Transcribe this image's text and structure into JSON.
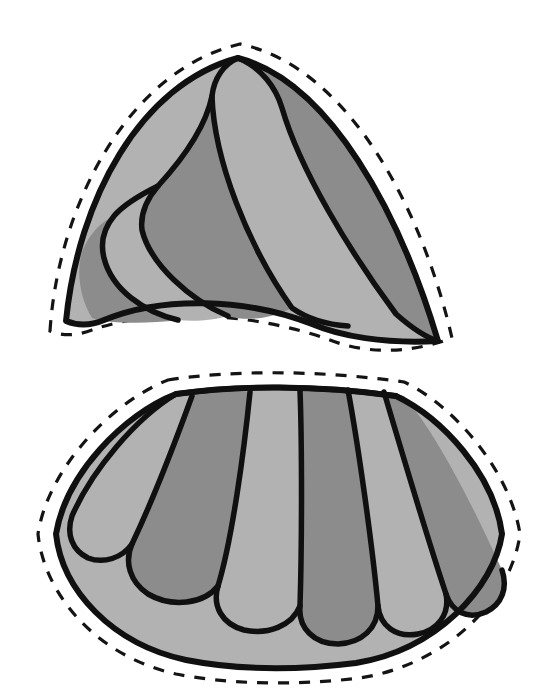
{
  "document": {
    "kind": "line-art-pattern-template",
    "title": "Two-piece fan pattern template",
    "background_color": "#ffffff",
    "ink_color": "#101010",
    "canvas": {
      "width": 560,
      "height": 691
    }
  },
  "palette": {
    "light_gray": "#b2b2b2",
    "dark_gray": "#8c8c8c",
    "outline_black": "#101010",
    "paper_white": "#ffffff"
  },
  "legend": {
    "solid_line_meaning": "sewn seam / stitching line",
    "dashed_line_meaning": "cutting line with seam allowance"
  },
  "pieces": [
    {
      "id": "upper-piece",
      "name": "Upper dome piece",
      "silhouette": "dome / pointed arch with curved base",
      "has_dashed_cut_line": true,
      "seam_allowance_px": 14,
      "segment_count": 5,
      "segments": [
        {
          "index": 1,
          "name": "outer-left-band",
          "tone": "light"
        },
        {
          "index": 2,
          "name": "inner-left-lobe",
          "tone": "light"
        },
        {
          "index": 3,
          "name": "mid-left-lobe",
          "tone": "dark"
        },
        {
          "index": 4,
          "name": "center-lobe",
          "tone": "light"
        },
        {
          "index": 5,
          "name": "right-lobe",
          "tone": "dark"
        }
      ],
      "bounds": {
        "x": 52,
        "y": 36,
        "width": 400,
        "height": 320
      }
    },
    {
      "id": "lower-piece",
      "name": "Lower fan / skirt piece",
      "silhouette": "fan — narrow curved top edge flaring to wide rounded bottom",
      "has_dashed_cut_line": true,
      "seam_allowance_px": 14,
      "segment_count": 8,
      "segments": [
        {
          "index": 1,
          "name": "petal-1",
          "tone": "light"
        },
        {
          "index": 2,
          "name": "petal-2",
          "tone": "dark"
        },
        {
          "index": 3,
          "name": "petal-3",
          "tone": "light"
        },
        {
          "index": 4,
          "name": "petal-4",
          "tone": "dark"
        },
        {
          "index": 5,
          "name": "petal-5",
          "tone": "light"
        },
        {
          "index": 6,
          "name": "petal-6",
          "tone": "dark"
        },
        {
          "index": 7,
          "name": "petal-7",
          "tone": "light"
        },
        {
          "index": 8,
          "name": "petal-8",
          "tone": "dark"
        }
      ],
      "base_band": {
        "name": "lower-ground-band",
        "tone": "light"
      },
      "bounds": {
        "x": 40,
        "y": 378,
        "width": 480,
        "height": 300
      }
    }
  ],
  "geometry": {
    "upper": {
      "cut_path": "M 50 331 C 58 206 128 70 240 44 C 352 68 424 216 452 338 C 404 356 360 352 330 340 C 258 314 160 306 92 330 C 76 336 62 336 50 331 Z",
      "seam_path": "M 66 321 C 78 200 140 84 238 58 C 330 82 400 214 438 341 C 384 344 340 336 312 324 C 246 298 162 296 104 320 C 90 326 78 326 66 321 Z",
      "fill_base_tone": "light",
      "seg_paths": [
        {
          "tone": "dark",
          "d": "M 438 341 C 400 214 330 82 238 58 C 262 68 276 88 282 108 C 300 170 350 252 396 314 C 414 330 428 338 438 341 Z"
        },
        {
          "tone": "light",
          "d": "M 396 318 C 352 252 300 170 282 108 C 276 86 260 66 238 58 C 224 64 214 78 212 96 C 214 160 248 246 292 308 C 310 322 328 324 344 326 C 364 328 382 322 396 318 Z"
        },
        {
          "tone": "dark",
          "d": "M 292 308 C 248 246 214 160 212 96 C 205 130 180 162 158 186 C 146 200 140 214 142 230 C 150 264 190 300 228 316 C 248 322 272 318 292 308 Z"
        },
        {
          "tone": "light",
          "d": "M 228 316 C 190 300 150 264 142 230 C 140 214 146 200 158 186 C 142 194 124 204 114 216 C 104 228 100 242 104 258 C 112 290 144 312 178 320 C 196 322 214 320 228 316 Z"
        },
        {
          "tone": "dark",
          "d": "M 178 320 C 144 312 112 290 104 258 C 100 242 104 228 114 216 C 100 222 88 236 82 252 C 76 272 80 298 92 318 C 110 324 148 324 178 320 Z"
        }
      ],
      "seg_lines": [
        "M 238 58 C 262 68 276 88 282 108 C 300 170 350 252 396 314 C 414 330 428 338 438 341",
        "M 238 58 C 224 64 214 78 212 96 C 214 160 248 246 292 308 C 312 322 332 325 348 326",
        "M 212 96 C 205 130 180 162 158 186 C 146 200 140 214 142 230 C 150 264 190 300 228 316",
        "M 158 186 C 142 194 124 204 114 216 C 104 228 100 242 104 258 C 112 290 144 312 178 320"
      ]
    },
    "lower": {
      "cut_path": "M 168 380 C 232 370 320 370 404 382 C 452 404 510 470 520 534 C 512 596 450 664 360 678 C 292 686 226 684 176 674 C 96 656 44 594 38 534 C 48 468 112 402 168 380 Z",
      "seam_path": "M 176 394 C 236 385 318 385 396 396 C 442 418 494 474 502 534 C 494 588 436 650 356 663 C 292 671 232 669 186 660 C 112 644 62 590 56 534 C 66 474 124 414 176 394 Z",
      "fill_base_tone": "light",
      "petal_paths": [
        {
          "tone": "light",
          "d": "M 176 394 C 136 418 92 470 72 516 C 66 534 72 550 88 558 C 104 564 122 558 132 544 C 150 506 176 440 192 396 C 186 394 180 393 176 394 Z"
        },
        {
          "tone": "dark",
          "d": "M 192 396 C 176 440 150 506 132 544 C 124 562 130 582 148 594 C 172 608 204 604 218 586 C 232 540 244 452 250 392 C 230 391 208 393 192 396 Z"
        },
        {
          "tone": "light",
          "d": "M 250 392 C 244 452 232 540 218 586 C 212 606 222 624 244 630 C 268 635 292 626 300 606 C 302 544 302 444 300 390 C 284 389 266 390 250 392 Z"
        },
        {
          "tone": "dark",
          "d": "M 300 390 C 302 444 302 544 300 606 C 298 628 314 644 338 644 C 362 643 378 628 378 606 C 372 542 358 444 348 390 C 332 389 316 389 300 390 Z"
        },
        {
          "tone": "light",
          "d": "M 348 390 C 358 444 372 542 378 606 C 380 626 396 638 418 634 C 438 630 450 614 446 594 C 426 534 400 446 384 392 C 372 390 360 389 348 390 Z"
        },
        {
          "tone": "dark",
          "d": "M 384 392 C 400 446 426 534 446 594 C 452 612 468 620 486 612 C 502 604 508 588 502 570 C 474 508 438 436 404 396 C 396 394 390 392 384 392 Z"
        }
      ],
      "petal_lines": [
        "M 192 396 C 176 440 150 506 132 544 C 124 562 130 582 148 594 C 172 608 204 604 218 586",
        "M 250 392 C 244 452 232 540 218 586 C 212 606 222 624 244 630 C 268 635 292 626 300 606",
        "M 300 390 C 302 444 302 544 300 606 C 298 628 314 644 338 644 C 362 643 378 628 378 606",
        "M 348 390 C 358 444 372 542 378 606 C 380 626 396 638 418 634 C 438 630 450 614 446 594",
        "M 384 392 C 400 446 426 534 446 594 C 452 612 468 620 486 612 C 502 604 508 588 502 570",
        "M 176 394 C 136 418 92 470 72 516 C 66 534 72 550 88 558 C 104 564 122 558 132 544"
      ],
      "top_edge": "M 176 394 C 236 385 318 385 396 396"
    }
  }
}
